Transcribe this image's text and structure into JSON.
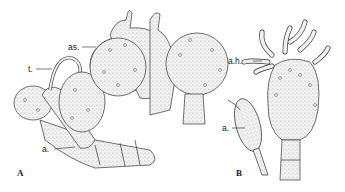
{
  "figure": {
    "panels": [
      {
        "id": "A",
        "label": "A",
        "annotations": [
          "as.",
          "t.",
          "a."
        ]
      },
      {
        "id": "B",
        "label": "B",
        "annotations": [
          "a.h.",
          "a."
        ]
      }
    ],
    "labels": {
      "as": "as.",
      "t": "t.",
      "a_A": "a.",
      "ah": "a.h.",
      "a_B": "a.",
      "panel_A": "A",
      "panel_B": "B"
    }
  }
}
